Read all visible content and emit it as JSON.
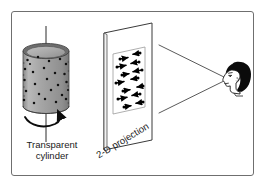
{
  "figure": {
    "border_color": "#6f6f6f",
    "background_color": "#ffffff"
  },
  "labels": {
    "cylinder": "Transparent\ncylinder",
    "cylinder_line1": "Transparent",
    "cylinder_line2": "cylinder",
    "projection": "2-D projection"
  },
  "cylinder": {
    "name": "transparent-cylinder",
    "body_fill": "#9e9e9e",
    "top_fill": "#b5b5b5",
    "rim_fill": "#6d6d6d",
    "dot_color": "#111111",
    "dot_count": 26,
    "rotation_axis": "vertical",
    "rotation_direction": "counterclockwise-viewed-from-top",
    "dots": [
      [
        0.18,
        0.14
      ],
      [
        0.42,
        0.1
      ],
      [
        0.66,
        0.16
      ],
      [
        0.86,
        0.23
      ],
      [
        0.1,
        0.27
      ],
      [
        0.33,
        0.31
      ],
      [
        0.55,
        0.26
      ],
      [
        0.78,
        0.33
      ],
      [
        0.93,
        0.38
      ],
      [
        0.07,
        0.44
      ],
      [
        0.26,
        0.48
      ],
      [
        0.48,
        0.42
      ],
      [
        0.7,
        0.49
      ],
      [
        0.9,
        0.53
      ],
      [
        0.13,
        0.6
      ],
      [
        0.37,
        0.57
      ],
      [
        0.59,
        0.63
      ],
      [
        0.82,
        0.6
      ],
      [
        0.95,
        0.67
      ],
      [
        0.2,
        0.73
      ],
      [
        0.44,
        0.76
      ],
      [
        0.67,
        0.72
      ],
      [
        0.88,
        0.79
      ],
      [
        0.09,
        0.85
      ],
      [
        0.52,
        0.88
      ],
      [
        0.76,
        0.9
      ]
    ]
  },
  "projection_screen": {
    "name": "projection-screen",
    "fill": "#ffffff",
    "edge_color": "#3a3a3a",
    "inner_panel_color": "#8a8a8a",
    "dot_color": "#000000",
    "vector_color": "#000000",
    "dot_count": 14,
    "description": "Dots with horizontal velocity vectors of varying length and direction"
  },
  "projection_dots": [
    {
      "x": 0.22,
      "y": 0.08,
      "vx": 0.26
    },
    {
      "x": 0.62,
      "y": 0.05,
      "vx": -0.22
    },
    {
      "x": 0.14,
      "y": 0.22,
      "vx": 0.3
    },
    {
      "x": 0.58,
      "y": 0.19,
      "vx": -0.26
    },
    {
      "x": 0.26,
      "y": 0.35,
      "vx": 0.22
    },
    {
      "x": 0.66,
      "y": 0.32,
      "vx": -0.3
    },
    {
      "x": 0.12,
      "y": 0.48,
      "vx": 0.28
    },
    {
      "x": 0.56,
      "y": 0.46,
      "vx": -0.24
    },
    {
      "x": 0.3,
      "y": 0.61,
      "vx": 0.24
    },
    {
      "x": 0.7,
      "y": 0.58,
      "vx": -0.2
    },
    {
      "x": 0.16,
      "y": 0.74,
      "vx": 0.3
    },
    {
      "x": 0.6,
      "y": 0.71,
      "vx": -0.28
    },
    {
      "x": 0.34,
      "y": 0.87,
      "vx": 0.22
    },
    {
      "x": 0.72,
      "y": 0.84,
      "vx": -0.24
    }
  ],
  "observer": {
    "name": "observer-head",
    "hair_color": "#0b0b0b",
    "skin_outline": "#1a1a1a",
    "orientation": "facing-left",
    "view_cone_color": "#5a5a5a"
  },
  "view_cone": {
    "apex_x": 228,
    "apex_y": 78,
    "top_x": 160,
    "top_y": 45,
    "bottom_x": 160,
    "bottom_y": 113
  }
}
